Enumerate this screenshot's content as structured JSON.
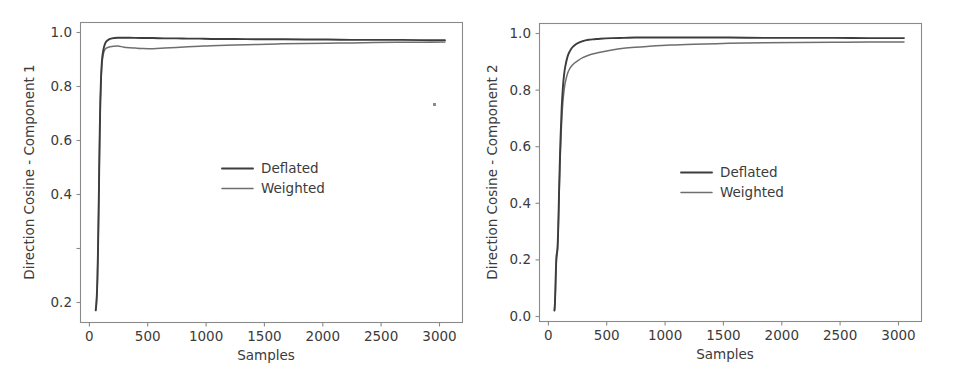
{
  "figure": {
    "background_color": "#ffffff",
    "width": 958,
    "height": 384,
    "panel_count": 2
  },
  "colors": {
    "deflated": "#3d3d3d",
    "weighted": "#6e6e6e",
    "axis": "#8a8a8a",
    "text": "#3b3b3b"
  },
  "chart_data": [
    {
      "type": "line",
      "panel": "left",
      "title": "",
      "xlabel": "Samples",
      "ylabel": "Direction Cosine - Component 1",
      "xlim": [
        -120,
        3150
      ],
      "ylim": [
        0.06,
        1.045
      ],
      "xticks": [
        0,
        500,
        1000,
        1500,
        2000,
        2500,
        3000
      ],
      "xticklabels": [
        "0",
        "500",
        "1000",
        "1500",
        "2000",
        "2500",
        "3000"
      ],
      "yticks": [
        0.2,
        0.4,
        0.6,
        0.8,
        1.0
      ],
      "yticklabels": [
        "0.2",
        "0.4",
        "0.6",
        "0.8",
        "1.0"
      ],
      "grid": false,
      "legend_position": "center",
      "legend_entries": [
        "Deflated",
        "Weighted"
      ],
      "annotations": [
        {
          "name": "stray-speck",
          "x": 2960,
          "y": 0.762
        }
      ],
      "series": [
        {
          "name": "Deflated",
          "color": "#3d3d3d",
          "x": [
            10,
            15,
            20,
            25,
            30,
            35,
            40,
            45,
            50,
            55,
            60,
            65,
            70,
            80,
            90,
            100,
            120,
            150,
            200,
            250,
            300,
            400,
            500,
            600,
            700,
            800,
            900,
            1000,
            1200,
            1400,
            1600,
            1800,
            2000,
            2200,
            2400,
            2600,
            2800,
            3000
          ],
          "y": [
            0.1,
            0.118,
            0.15,
            0.205,
            0.3,
            0.42,
            0.56,
            0.69,
            0.79,
            0.855,
            0.898,
            0.925,
            0.942,
            0.963,
            0.975,
            0.982,
            0.989,
            0.993,
            0.995,
            0.995,
            0.995,
            0.994,
            0.994,
            0.993,
            0.993,
            0.992,
            0.992,
            0.991,
            0.991,
            0.99,
            0.99,
            0.989,
            0.989,
            0.988,
            0.988,
            0.988,
            0.987,
            0.987
          ]
        },
        {
          "name": "Weighted",
          "color": "#6e6e6e",
          "x": [
            10,
            15,
            20,
            25,
            30,
            35,
            40,
            45,
            50,
            55,
            60,
            65,
            70,
            80,
            90,
            100,
            120,
            150,
            200,
            250,
            300,
            350,
            400,
            500,
            600,
            700,
            800,
            900,
            1000,
            1200,
            1400,
            1600,
            1800,
            2000,
            2200,
            2400,
            2600,
            2800,
            3000
          ],
          "y": [
            0.1,
            0.118,
            0.15,
            0.205,
            0.3,
            0.42,
            0.556,
            0.684,
            0.782,
            0.846,
            0.888,
            0.914,
            0.93,
            0.948,
            0.957,
            0.961,
            0.964,
            0.966,
            0.968,
            0.964,
            0.962,
            0.961,
            0.96,
            0.959,
            0.961,
            0.963,
            0.965,
            0.967,
            0.969,
            0.971,
            0.973,
            0.975,
            0.976,
            0.977,
            0.978,
            0.979,
            0.98,
            0.98,
            0.981
          ]
        }
      ]
    },
    {
      "type": "line",
      "panel": "right",
      "title": "",
      "xlabel": "Samples",
      "ylabel": "Direction Cosine - Component 2",
      "xlim": [
        -120,
        3150
      ],
      "ylim": [
        -0.035,
        1.045
      ],
      "xticks": [
        0,
        500,
        1000,
        1500,
        2000,
        2500,
        3000
      ],
      "xticklabels": [
        "0",
        "500",
        "1000",
        "1500",
        "2000",
        "2500",
        "3000"
      ],
      "yticks": [
        0.0,
        0.2,
        0.4,
        0.6,
        0.8,
        1.0
      ],
      "yticklabels": [
        "0.0",
        "0.2",
        "0.4",
        "0.6",
        "0.8",
        "1.0"
      ],
      "grid": false,
      "legend_position": "center",
      "legend_entries": [
        "Deflated",
        "Weighted"
      ],
      "series": [
        {
          "name": "Deflated",
          "color": "#3d3d3d",
          "x": [
            8,
            12,
            16,
            20,
            25,
            30,
            35,
            40,
            45,
            50,
            60,
            70,
            80,
            90,
            100,
            120,
            140,
            160,
            180,
            200,
            250,
            300,
            350,
            400,
            500,
            600,
            700,
            800,
            1000,
            1200,
            1500,
            1800,
            2100,
            2400,
            2700,
            3000
          ],
          "y": [
            0.005,
            0.03,
            0.08,
            0.145,
            0.2,
            0.215,
            0.24,
            0.3,
            0.39,
            0.48,
            0.63,
            0.74,
            0.812,
            0.858,
            0.888,
            0.925,
            0.945,
            0.958,
            0.966,
            0.972,
            0.981,
            0.986,
            0.988,
            0.99,
            0.992,
            0.993,
            0.994,
            0.994,
            0.994,
            0.994,
            0.994,
            0.993,
            0.993,
            0.993,
            0.992,
            0.992
          ]
        },
        {
          "name": "Weighted",
          "color": "#6e6e6e",
          "x": [
            8,
            12,
            16,
            20,
            25,
            30,
            35,
            40,
            45,
            50,
            60,
            70,
            80,
            90,
            100,
            120,
            140,
            160,
            180,
            200,
            250,
            300,
            350,
            400,
            500,
            600,
            700,
            800,
            1000,
            1200,
            1500,
            1800,
            2100,
            2400,
            2700,
            3000
          ],
          "y": [
            0.005,
            0.028,
            0.075,
            0.138,
            0.19,
            0.205,
            0.228,
            0.285,
            0.368,
            0.452,
            0.592,
            0.694,
            0.76,
            0.802,
            0.83,
            0.864,
            0.882,
            0.894,
            0.902,
            0.908,
            0.921,
            0.93,
            0.936,
            0.941,
            0.949,
            0.955,
            0.959,
            0.962,
            0.967,
            0.97,
            0.973,
            0.975,
            0.976,
            0.977,
            0.978,
            0.978
          ]
        }
      ]
    }
  ]
}
